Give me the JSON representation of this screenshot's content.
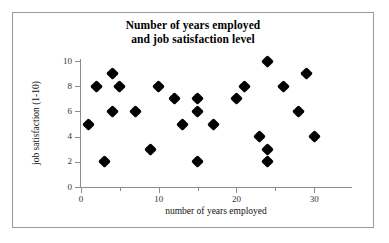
{
  "chart_data": {
    "type": "scatter",
    "title": "Number of years employed and job satisfaction level",
    "title_lines": [
      "Number of years employed",
      "and job satisfaction level"
    ],
    "xlabel": "number of years employed",
    "ylabel": "job satisfaction (1-10)",
    "xlim": [
      0,
      35
    ],
    "ylim": [
      0,
      10
    ],
    "xticks": [
      0,
      10,
      20,
      30
    ],
    "xtick_labels": [
      "0",
      "10",
      "20",
      "30"
    ],
    "xticks_minor": [
      5,
      15,
      25
    ],
    "yticks": [
      0,
      2,
      4,
      6,
      8,
      10
    ],
    "ytick_labels": [
      "0",
      "2",
      "4",
      "6",
      "8",
      "10"
    ],
    "grid": false,
    "legend": false,
    "marker": "filled-diamond",
    "marker_color": "#000000",
    "series": [
      {
        "name": "employees",
        "points": [
          {
            "x": 1,
            "y": 5
          },
          {
            "x": 2,
            "y": 8
          },
          {
            "x": 3,
            "y": 2
          },
          {
            "x": 4,
            "y": 9
          },
          {
            "x": 4,
            "y": 6
          },
          {
            "x": 5,
            "y": 8
          },
          {
            "x": 7,
            "y": 6
          },
          {
            "x": 9,
            "y": 3
          },
          {
            "x": 10,
            "y": 8
          },
          {
            "x": 12,
            "y": 7
          },
          {
            "x": 13,
            "y": 5
          },
          {
            "x": 15,
            "y": 7
          },
          {
            "x": 15,
            "y": 6
          },
          {
            "x": 15,
            "y": 2
          },
          {
            "x": 17,
            "y": 5
          },
          {
            "x": 20,
            "y": 7
          },
          {
            "x": 21,
            "y": 8
          },
          {
            "x": 23,
            "y": 4
          },
          {
            "x": 24,
            "y": 10
          },
          {
            "x": 24,
            "y": 3
          },
          {
            "x": 24,
            "y": 2
          },
          {
            "x": 26,
            "y": 8
          },
          {
            "x": 28,
            "y": 6
          },
          {
            "x": 29,
            "y": 9
          },
          {
            "x": 30,
            "y": 4
          }
        ]
      }
    ]
  },
  "colors": {
    "frame_border": "#9a9a9a",
    "axis": "#8c8c8c",
    "text": "#111111",
    "marker": "#000000",
    "background": "#ffffff"
  }
}
